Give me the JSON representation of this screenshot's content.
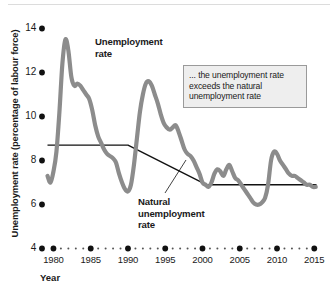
{
  "figure": {
    "background_color": "#ffffff",
    "series_color": "#8c8c8c",
    "natural_line_color": "#111111",
    "annotation_bg": "#eeeeee",
    "annotation_border": "#9a9a9a"
  },
  "labels": {
    "unemployment_rate": "Unemployment\nrate",
    "unemployment_rate_line1": "Unemployment",
    "unemployment_rate_line2": "rate",
    "natural_rate_line1": "Natural",
    "natural_rate_line2": "unemployment",
    "natural_rate_line3": "rate",
    "annotation": "... the unemployment rate exceeds the natural unemployment rate"
  },
  "chart_data": {
    "type": "line",
    "title": "",
    "xlabel": "Year",
    "ylabel": "Unemployment rate (percentage of labour force)",
    "xlim": [
      1979,
      2015.5
    ],
    "ylim": [
      4,
      14
    ],
    "yticks": [
      4,
      6,
      8,
      10,
      12,
      14
    ],
    "ytick_labels": [
      "4",
      "6",
      "8",
      "10",
      "12",
      "14"
    ],
    "xticks": [
      1980,
      1985,
      1990,
      1995,
      2000,
      2005,
      2010,
      2015
    ],
    "xtick_labels": [
      "1980",
      "1985",
      "1990",
      "1995",
      "2000",
      "2005",
      "2010",
      "2015"
    ],
    "grid": false,
    "legend": "none",
    "axis_style": "dotted-markers",
    "series": [
      {
        "name": "Unemployment rate",
        "color": "#8c8c8c",
        "x": [
          1979.2,
          1979.6,
          1980.0,
          1980.4,
          1980.8,
          1981.2,
          1981.6,
          1982.0,
          1982.4,
          1982.8,
          1983.2,
          1983.6,
          1984.0,
          1984.4,
          1984.8,
          1985.2,
          1985.6,
          1986.0,
          1986.4,
          1986.8,
          1987.2,
          1987.6,
          1988.0,
          1988.4,
          1988.8,
          1989.2,
          1989.6,
          1990.0,
          1990.4,
          1990.8,
          1991.2,
          1991.6,
          1992.0,
          1992.4,
          1992.8,
          1993.2,
          1993.6,
          1994.0,
          1994.4,
          1994.8,
          1995.2,
          1995.6,
          1996.0,
          1996.4,
          1996.8,
          1997.2,
          1997.6,
          1998.0,
          1998.4,
          1998.8,
          1999.2,
          1999.6,
          2000.0,
          2000.4,
          2000.8,
          2001.2,
          2001.6,
          2002.0,
          2002.4,
          2002.8,
          2003.2,
          2003.6,
          2004.0,
          2004.4,
          2004.8,
          2005.2,
          2005.6,
          2006.0,
          2006.4,
          2006.8,
          2007.2,
          2007.6,
          2008.0,
          2008.4,
          2008.8,
          2009.2,
          2009.6,
          2010.0,
          2010.4,
          2010.8,
          2011.2,
          2011.6,
          2012.0,
          2012.4,
          2012.8,
          2013.2,
          2013.6,
          2014.0,
          2014.4,
          2014.8,
          2015.2
        ],
        "y": [
          7.3,
          7.0,
          7.5,
          8.4,
          10.2,
          12.4,
          13.5,
          13.0,
          11.8,
          11.4,
          11.5,
          11.4,
          11.2,
          11.0,
          10.8,
          10.3,
          9.6,
          9.1,
          8.8,
          8.5,
          8.3,
          8.2,
          8.1,
          7.9,
          7.4,
          7.0,
          6.7,
          6.6,
          6.9,
          7.8,
          9.0,
          10.2,
          11.0,
          11.5,
          11.6,
          11.4,
          11.0,
          10.6,
          10.1,
          9.7,
          9.5,
          9.4,
          9.5,
          9.6,
          9.3,
          8.9,
          8.5,
          8.3,
          8.2,
          8.0,
          7.7,
          7.4,
          7.0,
          6.9,
          6.8,
          7.0,
          7.4,
          7.6,
          7.5,
          7.3,
          7.6,
          7.8,
          7.5,
          7.2,
          7.1,
          6.9,
          6.7,
          6.5,
          6.3,
          6.1,
          6.0,
          6.0,
          6.1,
          6.3,
          6.9,
          8.0,
          8.4,
          8.3,
          8.0,
          7.8,
          7.6,
          7.4,
          7.3,
          7.3,
          7.2,
          7.1,
          7.0,
          6.9,
          6.9,
          6.8,
          6.8
        ]
      },
      {
        "name": "Natural unemployment rate",
        "color": "#111111",
        "x": [
          1979.2,
          1990.0,
          2000.5,
          2015.3
        ],
        "y": [
          8.7,
          8.7,
          6.9,
          6.9
        ]
      }
    ],
    "annotations": [
      {
        "text": "... the unemployment rate exceeds the natural unemployment rate",
        "type": "callout-box"
      },
      {
        "text": "Unemployment rate",
        "type": "series-label"
      },
      {
        "text": "Natural unemployment rate",
        "type": "series-label-with-leader"
      }
    ]
  }
}
